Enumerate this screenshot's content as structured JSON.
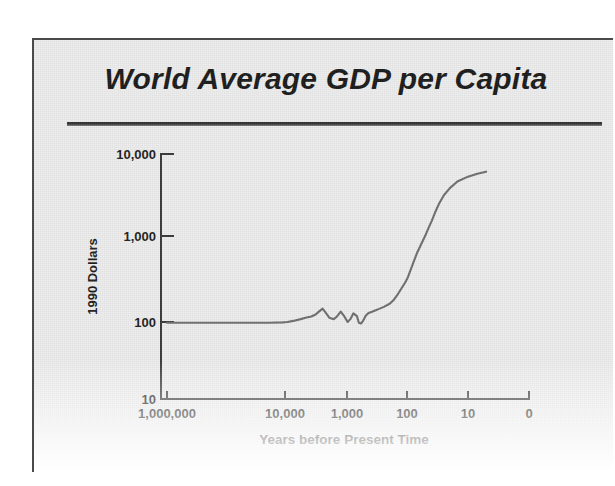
{
  "slide": {
    "title": "World Average GDP per Capita",
    "background_color": "#ededed",
    "title_color": "#1b1b1b",
    "rule_color": "#2c2c2c"
  },
  "chart_data": {
    "type": "line",
    "title": "World Average GDP per Capita",
    "xlabel": "Years before Present Time",
    "ylabel": "1990 Dollars",
    "xscale": "log-reversed",
    "yscale": "log",
    "xlim": [
      1000000,
      1
    ],
    "ylim": [
      10,
      10000
    ],
    "grid": false,
    "legend": null,
    "line_color": "#6b6b6b",
    "x_tick_labels": [
      "1,000,000",
      "10,000",
      "1,000",
      "100",
      "10",
      "0"
    ],
    "x_tick_values": [
      1000000,
      10000,
      1000,
      100,
      10,
      0
    ],
    "y_tick_labels": [
      "10,000",
      "1,000",
      "100",
      "10"
    ],
    "y_tick_values": [
      10000,
      1000,
      100,
      10
    ],
    "series": [
      {
        "name": "World average GDP per capita",
        "x": [
          1000000,
          300000,
          100000,
          50000,
          30000,
          20000,
          12000,
          10000,
          8000,
          6000,
          5000,
          4000,
          3400,
          3000,
          2600,
          2300,
          2000,
          1700,
          1500,
          1300,
          1150,
          1000,
          900,
          800,
          700,
          650,
          600,
          550,
          500,
          450,
          400,
          350,
          300,
          250,
          200,
          170,
          150,
          130,
          110,
          100,
          90,
          80,
          70,
          60,
          50,
          45,
          40,
          35,
          30,
          25,
          20,
          15,
          10,
          7,
          5
        ],
        "y": [
          98,
          98,
          98,
          98,
          98,
          98,
          99,
          100,
          103,
          108,
          112,
          116,
          122,
          132,
          143,
          128,
          112,
          108,
          116,
          132,
          118,
          100,
          108,
          126,
          117,
          98,
          96,
          104,
          118,
          127,
          131,
          136,
          142,
          150,
          163,
          182,
          205,
          240,
          290,
          330,
          400,
          500,
          640,
          800,
          1050,
          1250,
          1500,
          1900,
          2400,
          3000,
          3600,
          4300,
          4900,
          5300,
          5600
        ]
      }
    ]
  },
  "axes_geometry": {
    "note": "pixel anchors used to draw the plot inside the 581x434 slide",
    "y_axis_x": 127,
    "x_axis_y": 359,
    "x_right": 495,
    "y_top": 114,
    "y_px": {
      "10000": 114,
      "1000": 196,
      "100": 282,
      "10": 359
    },
    "x_px": {
      "1000000": 133,
      "10000": 251,
      "1000": 313,
      "100": 373,
      "10": 434,
      "0": 495
    }
  }
}
